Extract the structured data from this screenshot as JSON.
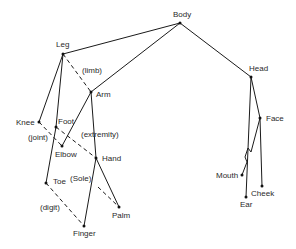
{
  "diagram": {
    "type": "semantic-hierarchy",
    "nodes": [
      {
        "id": "body",
        "label": "Body",
        "x": 180,
        "y": 23,
        "lx": 173,
        "ly": 17
      },
      {
        "id": "leg",
        "label": "Leg",
        "x": 63,
        "y": 54,
        "lx": 56,
        "ly": 47
      },
      {
        "id": "arm",
        "label": "Arm",
        "x": 91,
        "y": 92,
        "lx": 95,
        "ly": 97
      },
      {
        "id": "head",
        "label": "Head",
        "x": 251,
        "y": 77,
        "lx": 250,
        "ly": 70
      },
      {
        "id": "knee",
        "label": "Knee",
        "x": 39,
        "y": 122,
        "lx": 16,
        "ly": 125
      },
      {
        "id": "foot",
        "label": "Foot",
        "x": 56,
        "y": 127,
        "lx": 58,
        "ly": 124
      },
      {
        "id": "elbow",
        "label": "Elbow",
        "x": 62,
        "y": 146,
        "lx": 55,
        "ly": 156
      },
      {
        "id": "hand",
        "label": "Hand",
        "x": 96,
        "y": 158,
        "lx": 102,
        "ly": 161
      },
      {
        "id": "toe",
        "label": "Toe",
        "x": 46,
        "y": 183,
        "lx": 52,
        "ly": 184
      },
      {
        "id": "palm",
        "label": "Palm",
        "x": 119,
        "y": 207,
        "lx": 112,
        "ly": 218
      },
      {
        "id": "finger",
        "label": "Finger",
        "x": 84,
        "y": 226,
        "lx": 73,
        "ly": 236
      },
      {
        "id": "face",
        "label": "Face",
        "x": 260,
        "y": 118,
        "lx": 266,
        "ly": 121
      },
      {
        "id": "mouth",
        "label": "Mouth",
        "x": 242,
        "y": 175,
        "lx": 216,
        "ly": 178
      },
      {
        "id": "cheek",
        "label": "Cheek",
        "x": 262,
        "y": 186,
        "lx": 251,
        "ly": 196
      },
      {
        "id": "ear",
        "label": "Ear",
        "x": 246,
        "y": 197,
        "lx": 240,
        "ly": 207
      }
    ],
    "edges": [
      {
        "from": "body",
        "to": "leg",
        "style": "solid"
      },
      {
        "from": "body",
        "to": "arm",
        "style": "solid"
      },
      {
        "from": "body",
        "to": "head",
        "style": "solid"
      },
      {
        "from": "leg",
        "to": "arm",
        "style": "dashed",
        "label": "(limb)"
      },
      {
        "from": "leg",
        "to": "knee",
        "style": "solid"
      },
      {
        "from": "leg",
        "to": "foot",
        "style": "solid"
      },
      {
        "from": "foot",
        "to": "toe",
        "style": "solid"
      },
      {
        "from": "arm",
        "to": "elbow",
        "style": "solid"
      },
      {
        "from": "arm",
        "to": "hand",
        "style": "solid"
      },
      {
        "from": "knee",
        "to": "elbow",
        "style": "dashed",
        "label": "(joint)"
      },
      {
        "from": "foot",
        "to": "hand",
        "style": "dashed",
        "label": "(extremity)"
      },
      {
        "from": "hand",
        "to": "finger",
        "style": "solid"
      },
      {
        "from": "hand",
        "to": "palm",
        "style": "solid"
      },
      {
        "from": "foot",
        "to": "palm",
        "style": "dashed",
        "label": "(Sole)"
      },
      {
        "from": "toe",
        "to": "finger",
        "style": "dashed",
        "label": "(digit)"
      },
      {
        "from": "head",
        "to": "face",
        "style": "solid"
      },
      {
        "from": "head",
        "to": "ear",
        "style": "solid"
      },
      {
        "from": "face",
        "to": "cheek",
        "style": "solid"
      },
      {
        "from": "face",
        "to": "mouth",
        "style": "solid"
      }
    ],
    "edge_labels": {
      "limb": {
        "text": "(limb)",
        "x": 82,
        "y": 72
      },
      "joint": {
        "text": "(joint)",
        "x": 28,
        "y": 140
      },
      "extremity": {
        "text": "(extremity)",
        "x": 81,
        "y": 137
      },
      "sole": {
        "text": "(Sole)",
        "x": 70,
        "y": 181
      },
      "digit": {
        "text": "(digit)",
        "x": 40,
        "y": 210
      }
    }
  }
}
